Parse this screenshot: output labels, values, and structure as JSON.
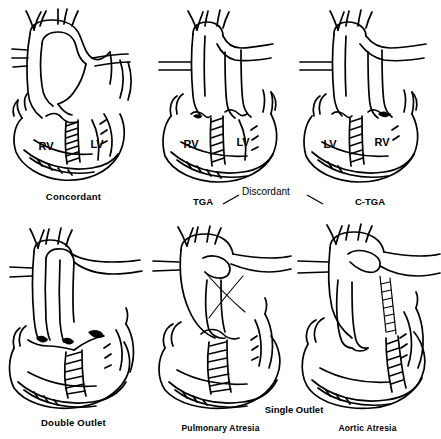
{
  "figure": {
    "type": "medical-line-diagram",
    "grid": {
      "rows": 2,
      "cols": 3
    },
    "ink_color": "#000000",
    "background": "#ffffff"
  },
  "panels": [
    {
      "id": "concordant",
      "row": 0,
      "col": 0,
      "caption": "Concordant",
      "caption_weight": "bold",
      "ventricle_labels": [
        "RV",
        "LV"
      ],
      "great_arteries": "crossing"
    },
    {
      "id": "tga",
      "row": 0,
      "col": 1,
      "caption": "TGA",
      "caption_weight": "bold",
      "ventricle_labels": [
        "RV",
        "LV"
      ],
      "great_arteries": "parallel"
    },
    {
      "id": "c-tga",
      "row": 0,
      "col": 2,
      "caption": "C-TGA",
      "caption_weight": "bold",
      "ventricle_labels": [
        "LV",
        "RV"
      ],
      "great_arteries": "parallel"
    },
    {
      "id": "double-outlet",
      "row": 1,
      "col": 0,
      "caption": "Double Outlet",
      "caption_weight": "bold",
      "ventricle_labels": [],
      "great_arteries": "side-by-side"
    },
    {
      "id": "pulmonary-atresia",
      "row": 1,
      "col": 1,
      "caption": "Pulmonary Atresia",
      "caption_weight": "bold",
      "ventricle_labels": [],
      "great_arteries": "single-trunk"
    },
    {
      "id": "aortic-atresia",
      "row": 1,
      "col": 2,
      "caption": "Aortic Atresia",
      "caption_weight": "bold",
      "ventricle_labels": [],
      "great_arteries": "single-trunk"
    }
  ],
  "group_labels": {
    "discordant": "Discordant",
    "discordant_left": "TGA",
    "discordant_right": "C-TGA",
    "single_outlet": "Single Outlet"
  }
}
